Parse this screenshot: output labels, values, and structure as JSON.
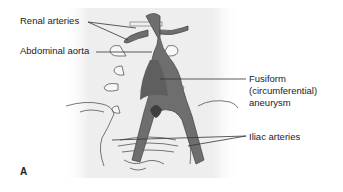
{
  "figure": {
    "panel_letter": "A",
    "labels": {
      "renal_arteries": "Renal arteries",
      "abdominal_aorta": "Abdominal aorta",
      "fusiform_line1": "Fusiform",
      "fusiform_line2": "(circumferential)",
      "fusiform_line3": "aneurysm",
      "iliac_arteries": "Iliac arteries"
    },
    "colors": {
      "vessel": "#6e6e6e",
      "vessel_dark": "#4f4f4f",
      "background_panel": "#f1f1f1",
      "outline": "#555555",
      "leader_line": "#333333"
    }
  }
}
